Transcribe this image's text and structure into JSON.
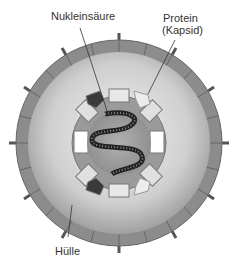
{
  "diagram": {
    "labels": {
      "nucleic_acid": "Nukleinsäure",
      "protein_line1": "Protein",
      "protein_line2": "(Kapsid)",
      "envelope": "Hülle"
    },
    "colors": {
      "envelope_ring": "#8c8c8c",
      "envelope_fill_light": "#e6e6e6",
      "envelope_fill_dark": "#a8a8a8",
      "capsid_core": "#9a9a9a",
      "capsomer_light": "#e8e8e8",
      "capsomer_dark": "#3a3a3a",
      "nucleic_acid": "#222222"
    }
  }
}
